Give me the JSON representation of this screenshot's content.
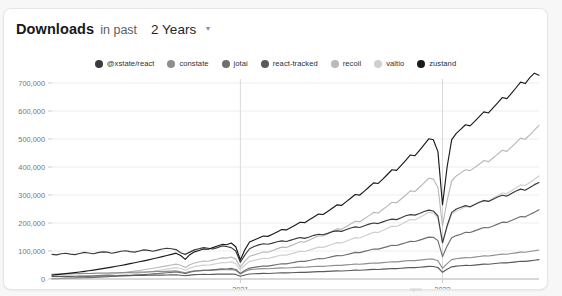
{
  "header": {
    "title": "Downloads",
    "subtitle": "in past",
    "range_value": "2 Years",
    "chevron": "▾"
  },
  "footnote": "npm",
  "colors": {
    "xstate_react": "#3a3a3a",
    "constate": "#8e8e8e",
    "jotai": "#6f6f6f",
    "react_tracked": "#5a5a5a",
    "recoil": "#b9b9b9",
    "valtio": "#cfcfcf",
    "zustand": "#1a1a1a",
    "grid": "#ededef",
    "axis_text": "#73767d"
  },
  "chart_data": {
    "type": "line",
    "title": "Downloads in past 2 Years",
    "xlabel": "",
    "ylabel": "",
    "ylim": [
      0,
      700000
    ],
    "yticks": [
      0,
      100000,
      200000,
      300000,
      400000,
      500000,
      600000,
      700000
    ],
    "ytick_labels": [
      "0",
      "100,000",
      "200,000",
      "300,000",
      "400,000",
      "500,000",
      "600,000",
      "700,000"
    ],
    "xticks": [
      "2021",
      "2022"
    ],
    "xtick_labels": [
      "2021",
      "2022"
    ],
    "grid": true,
    "legend_position": "top-center",
    "x_count": 105,
    "x_start_label": "2020-W01",
    "x_end_label": "2022-W52",
    "series": [
      {
        "name": "@xstate/react",
        "color": "#3a3a3a",
        "values": [
          88000,
          86000,
          90000,
          92000,
          89000,
          87000,
          91000,
          95000,
          93000,
          90000,
          94000,
          97000,
          96000,
          92000,
          95000,
          99000,
          101000,
          98000,
          96000,
          100000,
          104000,
          102000,
          99000,
          103000,
          107000,
          110000,
          108000,
          105000,
          94000,
          88000,
          96000,
          104000,
          108000,
          112000,
          110000,
          107000,
          112000,
          118000,
          116000,
          112000,
          100000,
          60000,
          86000,
          108000,
          116000,
          122000,
          126000,
          124000,
          128000,
          133000,
          136000,
          134000,
          139000,
          144000,
          148000,
          145000,
          150000,
          156000,
          160000,
          158000,
          163000,
          169000,
          172000,
          170000,
          176000,
          182000,
          186000,
          184000,
          190000,
          196000,
          200000,
          198000,
          204000,
          210000,
          214000,
          212000,
          219000,
          226000,
          230000,
          228000,
          234000,
          241000,
          246000,
          243000,
          225000,
          130000,
          190000,
          238000,
          250000,
          256000,
          262000,
          258000,
          266000,
          274000,
          280000,
          277000,
          285000,
          293000,
          299000,
          296000,
          305000,
          314000,
          321000,
          317000,
          327000,
          337000,
          345000
        ]
      },
      {
        "name": "constate",
        "color": "#8e8e8e",
        "values": [
          17000,
          17500,
          18000,
          18500,
          18200,
          18800,
          19400,
          20000,
          19600,
          20200,
          20900,
          21500,
          21200,
          21800,
          22500,
          23200,
          22900,
          23600,
          24300,
          25000,
          24700,
          25400,
          26200,
          27000,
          26700,
          27400,
          28200,
          29000,
          26000,
          22000,
          26500,
          29500,
          30300,
          31200,
          30900,
          31700,
          32600,
          33500,
          33100,
          34000,
          31000,
          18000,
          27000,
          33500,
          35000,
          36000,
          37000,
          36600,
          37600,
          38600,
          39600,
          39200,
          40300,
          41400,
          42500,
          42100,
          43300,
          44500,
          45700,
          45300,
          46600,
          47900,
          49200,
          48800,
          50200,
          51600,
          53000,
          52600,
          54100,
          55600,
          57100,
          56700,
          58300,
          59900,
          61500,
          61100,
          62800,
          64500,
          66200,
          65800,
          67600,
          69400,
          71300,
          70800,
          65000,
          38000,
          55000,
          69000,
          72500,
          74500,
          76500,
          76000,
          78200,
          80400,
          82600,
          82100,
          84400,
          86700,
          89000,
          88500,
          91000,
          93500,
          96000,
          95500,
          98200,
          100900,
          103500
        ]
      },
      {
        "name": "jotai",
        "color": "#6f6f6f",
        "values": [
          1200,
          1500,
          1900,
          2400,
          2800,
          3300,
          3900,
          4500,
          5100,
          5800,
          6500,
          7300,
          8100,
          8900,
          9800,
          10700,
          11600,
          12600,
          13600,
          14700,
          15800,
          17000,
          18200,
          19500,
          20800,
          22200,
          23600,
          25100,
          23000,
          19000,
          24000,
          27500,
          29200,
          31000,
          30600,
          32400,
          34300,
          36300,
          35900,
          38000,
          34000,
          20000,
          31000,
          39000,
          41500,
          44000,
          46600,
          46100,
          48800,
          51600,
          54500,
          54000,
          57000,
          60100,
          63300,
          62800,
          66100,
          69500,
          73000,
          72400,
          76000,
          79700,
          83500,
          82900,
          86800,
          90800,
          94900,
          94300,
          98500,
          102800,
          107200,
          106600,
          111100,
          115700,
          120400,
          119800,
          124600,
          129500,
          134500,
          133900,
          139000,
          144200,
          149500,
          148900,
          137000,
          80000,
          118000,
          147000,
          155000,
          160000,
          167000,
          166000,
          172000,
          178000,
          184000,
          183000,
          189000,
          196000,
          203000,
          202000,
          209000,
          216000,
          223000,
          222000,
          230000,
          238000,
          247000
        ]
      },
      {
        "name": "react-tracked",
        "color": "#5a5a5a",
        "values": [
          9000,
          9200,
          9500,
          9800,
          9600,
          9900,
          10200,
          10500,
          10300,
          10600,
          11000,
          11300,
          11100,
          11400,
          11800,
          12100,
          11900,
          12300,
          12700,
          13000,
          12800,
          13200,
          13600,
          14000,
          13800,
          14200,
          14600,
          15000,
          13500,
          11500,
          13800,
          15400,
          15900,
          16400,
          16200,
          16700,
          17200,
          17800,
          17500,
          18000,
          16400,
          9800,
          14500,
          18000,
          18700,
          19400,
          20100,
          19800,
          20500,
          21300,
          22000,
          21700,
          22500,
          23300,
          24100,
          23800,
          24600,
          25500,
          26400,
          26100,
          27000,
          27900,
          28800,
          28500,
          29500,
          30500,
          31500,
          31200,
          32200,
          33300,
          34400,
          34100,
          35200,
          36400,
          37600,
          37300,
          38500,
          39800,
          41100,
          40800,
          42100,
          43500,
          44900,
          44600,
          41000,
          24000,
          35000,
          43500,
          45800,
          47200,
          48700,
          48300,
          49800,
          51400,
          53000,
          52700,
          54400,
          56100,
          57900,
          57600,
          59400,
          61300,
          63200,
          62900,
          64900,
          66900,
          69000
        ]
      },
      {
        "name": "recoil",
        "color": "#b9b9b9",
        "values": [
          2000,
          2600,
          3300,
          4100,
          5000,
          6000,
          7100,
          8300,
          9600,
          11000,
          12500,
          14100,
          15800,
          17600,
          19500,
          21500,
          23600,
          25800,
          28100,
          30500,
          33000,
          35600,
          38300,
          41100,
          44000,
          47000,
          50100,
          53300,
          49000,
          41000,
          51000,
          57000,
          60500,
          64100,
          63500,
          67300,
          71200,
          75300,
          74500,
          78800,
          71000,
          42000,
          65000,
          81000,
          86000,
          91200,
          96600,
          95700,
          101500,
          107500,
          113700,
          112700,
          119200,
          126000,
          133000,
          131900,
          139200,
          146800,
          154600,
          153400,
          161600,
          170100,
          178900,
          177500,
          186800,
          196400,
          206400,
          204800,
          215400,
          226400,
          237800,
          235900,
          248200,
          261000,
          274200,
          272100,
          285800,
          300000,
          314700,
          312400,
          327600,
          343400,
          359700,
          356900,
          328000,
          190000,
          280000,
          350000,
          368000,
          379000,
          390000,
          387000,
          398000,
          410000,
          423000,
          419000,
          432000,
          446000,
          460000,
          456000,
          471000,
          487000,
          503000,
          499000,
          515000,
          532000,
          549000
        ]
      },
      {
        "name": "valtio",
        "color": "#cfcfcf",
        "values": [
          300,
          500,
          800,
          1200,
          1700,
          2300,
          3000,
          3800,
          4700,
          5700,
          6800,
          8000,
          9300,
          10700,
          12200,
          13800,
          15500,
          17300,
          19200,
          21200,
          23300,
          25500,
          27800,
          30200,
          32700,
          35300,
          38000,
          40800,
          37500,
          31500,
          39000,
          44000,
          46800,
          49700,
          49200,
          52200,
          55300,
          58500,
          57900,
          61200,
          55000,
          33000,
          50000,
          63000,
          66500,
          70200,
          74000,
          73300,
          77300,
          81500,
          85800,
          85100,
          89600,
          94200,
          99000,
          98200,
          103200,
          108400,
          113700,
          112800,
          118300,
          124000,
          129900,
          128800,
          134900,
          141200,
          147700,
          146600,
          153300,
          160200,
          167300,
          166100,
          173500,
          181100,
          188900,
          187600,
          195700,
          204000,
          212500,
          211100,
          219900,
          229000,
          238300,
          236400,
          217000,
          125000,
          185000,
          232000,
          243000,
          250000,
          258000,
          256000,
          264000,
          272000,
          281000,
          279000,
          288000,
          297000,
          307000,
          305000,
          315000,
          325000,
          336000,
          334000,
          345000,
          356000,
          368000
        ]
      },
      {
        "name": "zustand",
        "color": "#1a1a1a",
        "values": [
          14000,
          15500,
          17200,
          19000,
          20900,
          22900,
          25000,
          27200,
          29500,
          31900,
          34400,
          37000,
          39700,
          42500,
          45400,
          48400,
          51500,
          54700,
          58000,
          61400,
          64900,
          68500,
          72200,
          76000,
          79900,
          83900,
          88000,
          92200,
          84000,
          70000,
          87000,
          97000,
          102000,
          107200,
          106400,
          111900,
          117600,
          123500,
          122400,
          128600,
          115000,
          68000,
          105000,
          132000,
          139000,
          146200,
          153600,
          152300,
          160100,
          168200,
          176500,
          175200,
          184100,
          193300,
          202800,
          201300,
          211200,
          221400,
          231900,
          230300,
          241400,
          252800,
          264600,
          262800,
          275400,
          288400,
          301800,
          299800,
          313900,
          328400,
          343400,
          341200,
          357000,
          373300,
          390100,
          387700,
          405500,
          423900,
          442900,
          440200,
          459700,
          479900,
          500700,
          497200,
          455000,
          265000,
          400000,
          498000,
          520000,
          535000,
          551000,
          547000,
          563000,
          580000,
          597000,
          593000,
          611000,
          629000,
          648000,
          644000,
          663000,
          683000,
          703000,
          698000,
          719000,
          735000,
          728000
        ]
      }
    ]
  }
}
